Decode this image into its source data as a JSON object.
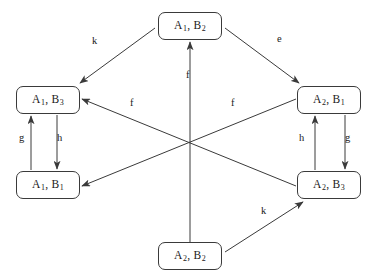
{
  "diagram": {
    "type": "state-transition-graph",
    "canvas": {
      "width": 377,
      "height": 280,
      "background": "#ffffff"
    },
    "stroke_color": "#3a3a3a",
    "text_color": "#1a1a1a",
    "nodes": [
      {
        "id": "a1b2",
        "name": "node-a1-b2",
        "a": "A",
        "a_sub": "1",
        "b": "B",
        "b_sub": "2",
        "text": "A1, B2",
        "x": 158,
        "y": 12,
        "w": 64,
        "h": 28
      },
      {
        "id": "a1b3",
        "name": "node-a1-b3",
        "a": "A",
        "a_sub": "1",
        "b": "B",
        "b_sub": "3",
        "text": "A1, B3",
        "x": 16,
        "y": 86,
        "w": 64,
        "h": 28
      },
      {
        "id": "a1b1",
        "name": "node-a1-b1",
        "a": "A",
        "a_sub": "1",
        "b": "B",
        "b_sub": "1",
        "text": "A1, B1",
        "x": 16,
        "y": 171,
        "w": 64,
        "h": 28
      },
      {
        "id": "a2b1",
        "name": "node-a2-b1",
        "a": "A",
        "a_sub": "2",
        "b": "B",
        "b_sub": "1",
        "text": "A2, B1",
        "x": 297,
        "y": 86,
        "w": 64,
        "h": 28
      },
      {
        "id": "a2b3",
        "name": "node-a2-b3",
        "a": "A",
        "a_sub": "2",
        "b": "B",
        "b_sub": "3",
        "text": "A2, B3",
        "x": 297,
        "y": 171,
        "w": 64,
        "h": 28
      },
      {
        "id": "a2b2",
        "name": "node-a2-b2",
        "a": "A",
        "a_sub": "2",
        "b": "B",
        "b_sub": "2",
        "text": "A2, B2",
        "x": 158,
        "y": 242,
        "w": 64,
        "h": 28
      }
    ],
    "edges": [
      {
        "id": "e-k-top-left",
        "name": "edge-k-a1b2-to-a1b3",
        "label": "k",
        "from": "a1b2",
        "to": "a1b3",
        "x1": 155,
        "y1": 28,
        "x2": 80,
        "y2": 83,
        "lx": 96,
        "ly": 42
      },
      {
        "id": "e-e-top-right",
        "name": "edge-e-a1b2-to-a2b1",
        "label": "e",
        "from": "a1b2",
        "to": "a2b1",
        "x1": 225,
        "y1": 28,
        "x2": 299,
        "y2": 83,
        "lx": 281,
        "ly": 40
      },
      {
        "id": "e-f-vertical",
        "name": "edge-f-a2b2-to-a1b2",
        "label": "f",
        "from": "a2b2",
        "to": "a1b2",
        "x1": 190,
        "y1": 242,
        "x2": 190,
        "y2": 42,
        "lx": 190,
        "ly": 76
      },
      {
        "id": "e-f-left",
        "name": "edge-f-a2b3-to-a1b3",
        "label": "f",
        "from": "a2b3",
        "to": "a1b3",
        "x1": 296,
        "y1": 186,
        "x2": 82,
        "y2": 99,
        "lx": 134,
        "ly": 104
      },
      {
        "id": "e-f-right",
        "name": "edge-f-a2b1-to-a1b1",
        "label": "f",
        "from": "a2b1",
        "to": "a1b1",
        "x1": 296,
        "y1": 99,
        "x2": 82,
        "y2": 186,
        "lx": 235,
        "ly": 104
      },
      {
        "id": "e-g-left",
        "name": "edge-g-a1b1-to-a1b3",
        "label": "g",
        "from": "a1b1",
        "to": "a1b3",
        "x1": 31,
        "y1": 170,
        "x2": 31,
        "y2": 116,
        "lx": 23,
        "ly": 139
      },
      {
        "id": "e-h-left",
        "name": "edge-h-a1b3-to-a1b1",
        "label": "h",
        "from": "a1b3",
        "to": "a1b1",
        "x1": 57,
        "y1": 115,
        "x2": 57,
        "y2": 169,
        "lx": 61,
        "ly": 139
      },
      {
        "id": "e-h-right",
        "name": "edge-h-a2b3-to-a2b1",
        "label": "h",
        "from": "a2b3",
        "to": "a2b1",
        "x1": 315,
        "y1": 170,
        "x2": 315,
        "y2": 116,
        "lx": 303,
        "ly": 139
      },
      {
        "id": "e-g-right",
        "name": "edge-g-a2b1-to-a2b3",
        "label": "g",
        "from": "a2b1",
        "to": "a2b3",
        "x1": 345,
        "y1": 115,
        "x2": 345,
        "y2": 169,
        "lx": 349,
        "ly": 139
      },
      {
        "id": "e-k-bottom",
        "name": "edge-k-a2b2-to-a2b3",
        "label": "k",
        "from": "a2b2",
        "to": "a2b3",
        "x1": 225,
        "y1": 252,
        "x2": 303,
        "y2": 202,
        "lx": 265,
        "ly": 212
      }
    ]
  }
}
